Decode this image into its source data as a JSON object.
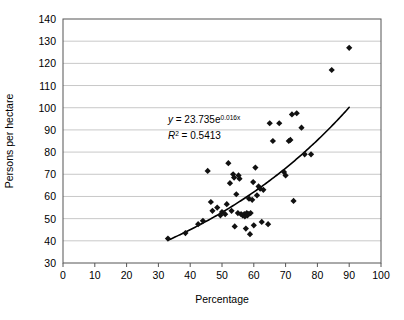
{
  "chart_data": {
    "type": "scatter",
    "title": "",
    "xlabel": "Percentage",
    "ylabel": "Persons per hectare",
    "xlim": [
      0,
      100
    ],
    "ylim": [
      30,
      140
    ],
    "xticks": [
      "0",
      "10",
      "20",
      "30",
      "40",
      "50",
      "60",
      "70",
      "80",
      "90",
      "100"
    ],
    "yticks": [
      "30",
      "40",
      "50",
      "60",
      "70",
      "80",
      "90",
      "100",
      "110",
      "120",
      "130",
      "140"
    ],
    "xtick_step": 10,
    "ytick_step": 10,
    "grid": "horizontal",
    "legend": "none",
    "marker": "diamond",
    "marker_color": "#111111",
    "trendline_color": "#000000",
    "gridline_color": "#c8c8c8",
    "axis_color": "#555555",
    "annotations": {
      "equation_y": "y",
      "equation_eq": " = 23.735e",
      "equation_exp": "0.016x",
      "r2_sym": "R",
      "r2_sup": "2",
      "r2_val": " = 0.5413",
      "equation_full": "y = 23.735e^0.016x",
      "r2_full": "R2 = 0.5413",
      "equation_x": 33,
      "equation_y_pos": 93,
      "r2_x": 33,
      "r2_y_pos": 86
    },
    "fit": {
      "kind": "exponential",
      "a": 23.735,
      "b": 0.016,
      "r_squared": 0.5413,
      "x_start": 33,
      "x_end": 90
    },
    "points": [
      {
        "x": 33.0,
        "y": 41.0
      },
      {
        "x": 38.5,
        "y": 43.5
      },
      {
        "x": 42.5,
        "y": 47.5
      },
      {
        "x": 44.0,
        "y": 49.0
      },
      {
        "x": 45.5,
        "y": 71.5
      },
      {
        "x": 46.5,
        "y": 57.5
      },
      {
        "x": 47.0,
        "y": 53.5
      },
      {
        "x": 48.5,
        "y": 55.0
      },
      {
        "x": 49.5,
        "y": 51.5
      },
      {
        "x": 50.0,
        "y": 53.0
      },
      {
        "x": 51.0,
        "y": 52.0
      },
      {
        "x": 51.5,
        "y": 56.5
      },
      {
        "x": 52.0,
        "y": 75.0
      },
      {
        "x": 52.5,
        "y": 66.0
      },
      {
        "x": 53.0,
        "y": 53.5
      },
      {
        "x": 53.5,
        "y": 70.0
      },
      {
        "x": 53.8,
        "y": 68.5
      },
      {
        "x": 54.0,
        "y": 46.5
      },
      {
        "x": 54.5,
        "y": 61.0
      },
      {
        "x": 55.0,
        "y": 52.5
      },
      {
        "x": 55.2,
        "y": 69.5
      },
      {
        "x": 55.5,
        "y": 68.0
      },
      {
        "x": 56.0,
        "y": 52.0
      },
      {
        "x": 56.5,
        "y": 51.5
      },
      {
        "x": 57.0,
        "y": 52.0
      },
      {
        "x": 57.2,
        "y": 51.0
      },
      {
        "x": 57.5,
        "y": 45.5
      },
      {
        "x": 57.8,
        "y": 52.5
      },
      {
        "x": 58.0,
        "y": 51.5
      },
      {
        "x": 58.3,
        "y": 52.0
      },
      {
        "x": 58.5,
        "y": 59.0
      },
      {
        "x": 58.8,
        "y": 43.0
      },
      {
        "x": 59.0,
        "y": 52.5
      },
      {
        "x": 59.5,
        "y": 58.5
      },
      {
        "x": 59.8,
        "y": 66.5
      },
      {
        "x": 60.0,
        "y": 47.0
      },
      {
        "x": 60.5,
        "y": 73.0
      },
      {
        "x": 61.0,
        "y": 60.5
      },
      {
        "x": 61.5,
        "y": 64.5
      },
      {
        "x": 62.0,
        "y": 63.5
      },
      {
        "x": 62.5,
        "y": 48.5
      },
      {
        "x": 63.0,
        "y": 63.0
      },
      {
        "x": 64.5,
        "y": 47.5
      },
      {
        "x": 65.0,
        "y": 93.0
      },
      {
        "x": 66.0,
        "y": 85.0
      },
      {
        "x": 68.0,
        "y": 93.0
      },
      {
        "x": 69.5,
        "y": 71.0
      },
      {
        "x": 70.0,
        "y": 69.5
      },
      {
        "x": 71.0,
        "y": 85.0
      },
      {
        "x": 71.5,
        "y": 85.5
      },
      {
        "x": 72.0,
        "y": 97.0
      },
      {
        "x": 72.5,
        "y": 58.0
      },
      {
        "x": 73.5,
        "y": 97.5
      },
      {
        "x": 75.0,
        "y": 91.0
      },
      {
        "x": 76.0,
        "y": 79.0
      },
      {
        "x": 78.0,
        "y": 79.0
      },
      {
        "x": 84.5,
        "y": 117.0
      },
      {
        "x": 90.0,
        "y": 127.0
      }
    ]
  }
}
